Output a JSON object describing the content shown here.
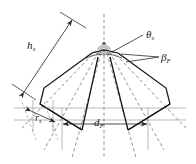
{
  "figure": {
    "type": "technical-line-diagram",
    "background_color": "#ffffff",
    "line_color": "#1a1a1a",
    "dashed_color": "#555555",
    "dimension_color": "#777777"
  },
  "labels": {
    "height": {
      "symbol": "h",
      "subscript": "s",
      "name": "h_s"
    },
    "apex_angle": {
      "symbol": "θ",
      "subscript": "s",
      "name": "theta_s"
    },
    "flank_angle": {
      "symbol": "β",
      "subscript": "F",
      "name": "beta_F"
    },
    "radius": {
      "symbol": "r",
      "subscript": "s",
      "name": "r_s"
    },
    "width": {
      "symbol": "d",
      "subscript": "F",
      "name": "d_F"
    }
  },
  "geometry": {
    "apex": {
      "x": 104,
      "y": 42
    },
    "fan_rays": 9,
    "outline_note": "symmetric fan / trapezoidal sector outline",
    "dimension_lines": [
      "h_s",
      "r_s",
      "d_F"
    ],
    "angle_arcs": [
      "theta_s"
    ]
  }
}
